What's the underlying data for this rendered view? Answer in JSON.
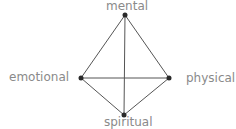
{
  "diagram": {
    "type": "tetrahedron",
    "colors": {
      "edge": "#555555",
      "vertex": "#2a2a2a",
      "label": "#8a8a8a"
    },
    "nodes": [
      {
        "id": "mental",
        "label": "mental",
        "x": 125,
        "y": 15
      },
      {
        "id": "emotional",
        "label": "emotional",
        "x": 81,
        "y": 78
      },
      {
        "id": "physical",
        "label": "physical",
        "x": 169,
        "y": 78
      },
      {
        "id": "spiritual",
        "label": "spiritual",
        "x": 124,
        "y": 115
      }
    ],
    "edges": [
      {
        "from": "mental",
        "to": "emotional"
      },
      {
        "from": "mental",
        "to": "physical"
      },
      {
        "from": "mental",
        "to": "spiritual"
      },
      {
        "from": "emotional",
        "to": "physical"
      },
      {
        "from": "emotional",
        "to": "spiritual"
      },
      {
        "from": "physical",
        "to": "spiritual"
      }
    ]
  },
  "labels": {
    "mental": "mental",
    "emotional": "emotional",
    "physical": "physical",
    "spiritual": "spiritual"
  }
}
